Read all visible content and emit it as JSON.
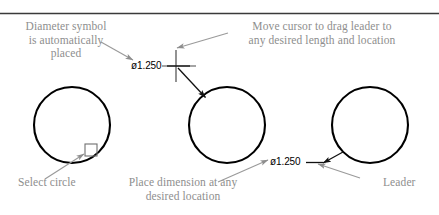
{
  "figure": {
    "type": "cad-instructional-diagram",
    "topic": "Creating a diameter dimension with a leader on a circle",
    "background_color": "#ffffff",
    "geometry_color": "#000000",
    "annotation_color": "#8e8e8e",
    "dimension_color": "#000000"
  },
  "divider": {
    "name": "top-rule",
    "color": "#3a3a3a"
  },
  "annotations": [
    {
      "id": "diameter-symbol-note",
      "text": "Diameter symbol\nis automatically\nplaced",
      "align": "center"
    },
    {
      "id": "move-cursor-note",
      "text": "Move cursor to drag leader to\nany desired length and location",
      "align": "center"
    },
    {
      "id": "select-circle-note",
      "text": "Select circle",
      "align": "left"
    },
    {
      "id": "place-dimension-note",
      "text": "Place dimension at any\ndesired location",
      "align": "center"
    },
    {
      "id": "leader-note",
      "text": "Leader",
      "align": "left"
    }
  ],
  "dimensions": [
    {
      "id": "dimension-text-middle",
      "value": "ø1.250",
      "symbol": "ø",
      "number": "1.250"
    },
    {
      "id": "dimension-text-right",
      "value": "ø1.250",
      "symbol": "ø",
      "number": "1.250"
    }
  ],
  "circles": [
    {
      "id": "circle-left",
      "label": "circle-step-1-select",
      "cx": 72,
      "cy": 125,
      "r": 38
    },
    {
      "id": "circle-middle",
      "label": "circle-step-2-drag",
      "cx": 227,
      "cy": 125,
      "r": 38
    },
    {
      "id": "circle-right",
      "label": "circle-step-3-placed",
      "cx": 370,
      "cy": 125,
      "r": 38
    }
  ],
  "markers": {
    "pickbox": {
      "id": "pick-box",
      "label": "selection pick box on circle"
    },
    "crosshair": {
      "id": "crosshair-cursor",
      "label": "drawing crosshair cursor"
    }
  }
}
